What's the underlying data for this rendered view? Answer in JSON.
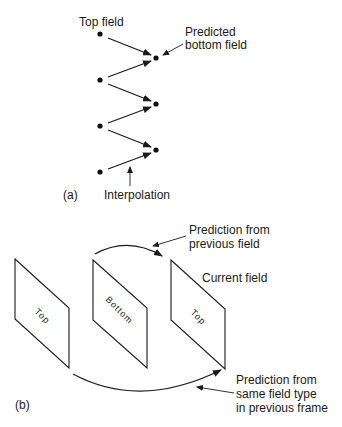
{
  "figure_a": {
    "label": "(a)",
    "top_field_label": "Top field",
    "predicted_label_line1": "Predicted",
    "predicted_label_line2": "bottom field",
    "interpolation_label": "Interpolation",
    "top_field_dots": 4,
    "bottom_field_dots": 3
  },
  "figure_b": {
    "label": "(b)",
    "panels": [
      {
        "label": "Top"
      },
      {
        "label": "Bottom"
      },
      {
        "label": "Top"
      }
    ],
    "current_field_label": "Current field",
    "prev_field_label_line1": "Prediction from",
    "prev_field_label_line2": "previous field",
    "prev_frame_label_line1": "Prediction from",
    "prev_frame_label_line2": "same field type",
    "prev_frame_label_line3": "in previous frame"
  },
  "colors": {
    "ink": "#1a1a1a",
    "background": "#ffffff"
  }
}
